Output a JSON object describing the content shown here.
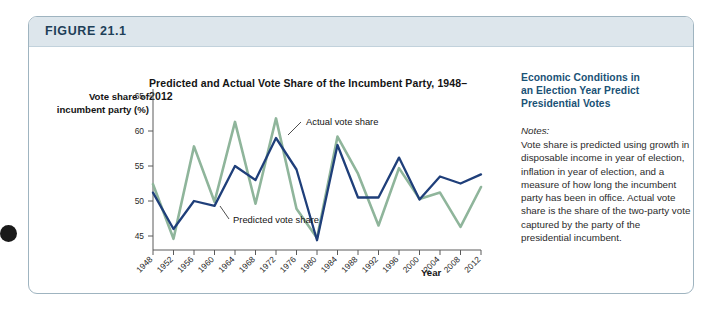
{
  "figure": {
    "number_label": "FIGURE 21.1"
  },
  "chart": {
    "title": "Predicted and Actual Vote Share of the Incumbent Party, 1948–2012",
    "y_axis_title": "Vote share of\nincumbent party (%)",
    "y_axis_title_line1": "Vote share of",
    "y_axis_title_line2": "incumbent party (%)",
    "x_axis_title": "Year",
    "annotation_actual": "Actual vote share",
    "annotation_predicted": "Predicted vote share"
  },
  "chart_data": {
    "type": "line",
    "title": "Predicted and Actual Vote Share of the Incumbent Party, 1948–2012",
    "xlabel": "Year",
    "ylabel": "Vote share of incumbent party (%)",
    "xlim": [
      1948,
      2012
    ],
    "ylim": [
      43,
      66
    ],
    "yticks": [
      45,
      50,
      55,
      60,
      65
    ],
    "grid": false,
    "legend": "annotations-inline",
    "categories": [
      1948,
      1952,
      1956,
      1960,
      1964,
      1968,
      1972,
      1976,
      1980,
      1984,
      1988,
      1992,
      1996,
      2000,
      2004,
      2008,
      2012
    ],
    "series": [
      {
        "name": "Predicted vote share",
        "color": "#1f3f7a",
        "values": [
          51.2,
          46.0,
          50.0,
          49.3,
          55.0,
          53.0,
          59.0,
          54.5,
          44.4,
          58.0,
          50.5,
          50.5,
          56.2,
          50.2,
          53.5,
          52.5,
          53.8
        ]
      },
      {
        "name": "Actual vote share",
        "color": "#8fb59b",
        "values": [
          52.4,
          44.6,
          57.8,
          49.9,
          61.3,
          49.6,
          61.8,
          48.9,
          44.7,
          59.2,
          53.9,
          46.5,
          54.7,
          50.3,
          51.2,
          46.3,
          52.0
        ]
      }
    ]
  },
  "notes": {
    "heading": "Economic Conditions in an Election Year Predict Presidential Votes",
    "heading_line1": "Economic Conditions in",
    "heading_line2": "an Election Year Predict",
    "heading_line3": "Presidential Votes",
    "label": "Notes:",
    "body": "Vote share is predicted using growth in disposable income in year of election, inflation in year of election, and a measure of how long the incumbent party has been in office. Actual vote share is the share of the two-party vote captured by the party of the presidential incumbent."
  }
}
